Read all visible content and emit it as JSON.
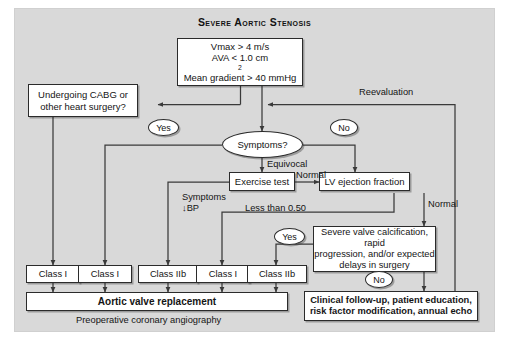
{
  "figure": {
    "title": "Severe Aortic Stenosis",
    "background_color": "#d9d9d9",
    "line_color": "#3a3a3a",
    "box_fill": "#ffffff"
  },
  "nodes": {
    "criteria": {
      "line1": "Vmax > 4 m/s",
      "line2_pre": "AVA < 1.0 cm",
      "line2_sup": "2",
      "line3": "Mean gradient > 40 mmHg"
    },
    "cabg": {
      "line1": "Undergoing CABG or",
      "line2": "other heart surgery?"
    },
    "symptoms": {
      "text": "Symptoms?"
    },
    "exercise_test": {
      "text": "Exercise test"
    },
    "lv_ejection": {
      "text": "LV ejection fraction"
    },
    "severe_calcification": {
      "line1": "Severe valve calcification, rapid",
      "line2": "progression, and/or expected",
      "line3": "delays in surgery"
    },
    "class_boxes": [
      {
        "id": "class-1-a",
        "text": "Class I"
      },
      {
        "id": "class-1-b",
        "text": "Class I"
      },
      {
        "id": "class-2b-a",
        "text": "Class IIb"
      },
      {
        "id": "class-1-c",
        "text": "Class I"
      },
      {
        "id": "class-2b-b",
        "text": "Class IIb"
      }
    ],
    "avr": {
      "text": "Aortic valve replacement"
    },
    "clinical_followup": {
      "line1": "Clinical follow-up, patient education,",
      "line2": "risk factor modification, annual echo"
    }
  },
  "bubbles": {
    "yes_cabg": "Yes",
    "no_symptoms": "No",
    "yes_calcification": "Yes",
    "no_calcification": "No"
  },
  "edge_labels": {
    "reevaluation": "Reevaluation",
    "equivocal": "Equivocal",
    "normal_exercise": "Normal",
    "normal_lvef": "Normal",
    "symptoms_bp_line1": "Symptoms",
    "symptoms_bp_line2": "↓BP",
    "less_than_050": "Less than 0.50"
  },
  "footnote": {
    "text": "Preoperative coronary angiography"
  }
}
